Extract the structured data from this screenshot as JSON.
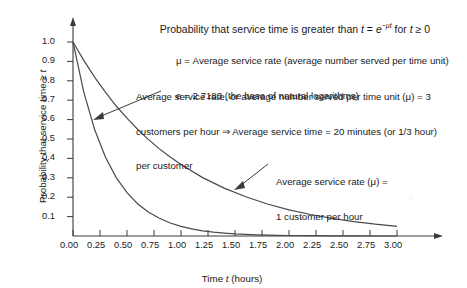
{
  "chart_data": {
    "type": "line",
    "title": "Probability that service time is greater than t = e−μt for t ≥ 0",
    "title_parts": {
      "lead": "Probability that service time is greater than ",
      "var_t": "t",
      "equals": " = ",
      "base_e": "e",
      "exponent": "−μt",
      "for": " for ",
      "var_t2": "t",
      "ge_zero": " ≥ 0"
    },
    "xlabel": "Time t (hours)",
    "xlabel_parts": {
      "pre": "Time ",
      "ital": "t",
      "post": " (hours)"
    },
    "ylabel": "Probability that service time ≥ t",
    "ylabel_parts": {
      "pre": "Probability that service time ≥ ",
      "ital": "t"
    },
    "xlim": [
      0,
      3.0
    ],
    "ylim": [
      0,
      1.05
    ],
    "xticks": [
      "0.00",
      "0.25",
      "0.50",
      "0.75",
      "1.00",
      "1.25",
      "1.50",
      "1.75",
      "2.00",
      "2.25",
      "2.50",
      "2.75",
      "3.00"
    ],
    "xtick_values": [
      0,
      0.25,
      0.5,
      0.75,
      1.0,
      1.25,
      1.5,
      1.75,
      2.0,
      2.25,
      2.5,
      2.75,
      3.0
    ],
    "yticks": [
      "0.1",
      "0.2",
      "0.3",
      "0.4",
      "0.5",
      "0.6",
      "0.7",
      "0.8",
      "0.9",
      "1.0"
    ],
    "ytick_values": [
      0.1,
      0.2,
      0.3,
      0.4,
      0.5,
      0.6,
      0.7,
      0.8,
      0.9,
      1.0
    ],
    "grid": false,
    "legend_position": "annotations-inline",
    "series": [
      {
        "name": "mu = 3 customers per hour",
        "mu": 3,
        "formula": "e^(-3t)",
        "x": [
          0,
          0.1,
          0.2,
          0.3,
          0.4,
          0.5,
          0.6,
          0.7,
          0.8,
          0.9,
          1.0,
          1.1,
          1.2,
          1.3,
          1.4,
          1.5,
          1.6,
          1.7,
          1.8,
          1.9,
          2.0,
          2.2,
          2.4,
          2.6,
          2.8,
          3.0
        ],
        "values": [
          1.0,
          0.741,
          0.549,
          0.407,
          0.301,
          0.223,
          0.165,
          0.122,
          0.091,
          0.067,
          0.05,
          0.037,
          0.027,
          0.02,
          0.015,
          0.011,
          0.008,
          0.006,
          0.0045,
          0.0033,
          0.0025,
          0.0014,
          0.00075,
          0.0004,
          0.00022,
          0.00012
        ]
      },
      {
        "name": "mu = 1 customer per hour",
        "mu": 1,
        "formula": "e^(-t)",
        "x": [
          0,
          0.1,
          0.2,
          0.3,
          0.4,
          0.5,
          0.6,
          0.7,
          0.8,
          0.9,
          1.0,
          1.2,
          1.4,
          1.6,
          1.8,
          2.0,
          2.2,
          2.4,
          2.6,
          2.8,
          3.0
        ],
        "values": [
          1.0,
          0.905,
          0.819,
          0.741,
          0.67,
          0.607,
          0.549,
          0.497,
          0.449,
          0.407,
          0.368,
          0.301,
          0.247,
          0.202,
          0.165,
          0.135,
          0.111,
          0.091,
          0.074,
          0.061,
          0.05
        ]
      }
    ],
    "annotations": [
      {
        "id": "mu-definition",
        "lines": [
          "μ = Average service rate (average number served per time unit)",
          "e = 2.7183 (the base of natural logarithms)"
        ]
      },
      {
        "id": "mu3-callout",
        "lines": [
          "Average service rate, or average number served per time unit (μ) = 3",
          "customers per hour ⇒ Average service time = 20 minutes (or 1/3 hour)",
          "per customer"
        ],
        "points_to_series": "mu = 3 customers per hour"
      },
      {
        "id": "mu1-callout",
        "lines": [
          "Average service rate (μ) =",
          "1 customer per hour"
        ],
        "points_to_series": "mu = 1 customer per hour"
      }
    ],
    "colors": {
      "curve": "#4a4a4a",
      "axis": "#3a3a3a",
      "text": "#1a1a1a",
      "background": "#ffffff"
    }
  }
}
